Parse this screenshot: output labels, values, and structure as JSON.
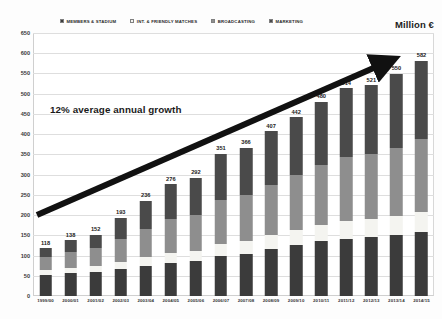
{
  "unit_caption": "Million €",
  "annotation": "12% average annual growth",
  "legend": [
    {
      "label": "MEMBERS & STADIUM",
      "color": "#3b3b3b",
      "icon": "square-swatch-icon"
    },
    {
      "label": "INT. & FRIENDLY MATCHES",
      "color": "#f4f4f0",
      "icon": "square-swatch-icon"
    },
    {
      "label": "BROADCASTING",
      "color": "#8e8e8e",
      "icon": "square-swatch-icon"
    },
    {
      "label": "MARKETING",
      "color": "#4a4a4a",
      "icon": "square-swatch-icon"
    }
  ],
  "chart_data": {
    "type": "bar",
    "stacked": true,
    "title": "",
    "subtitle": "",
    "xlabel": "",
    "ylabel": "Million €",
    "ylim": [
      0,
      650
    ],
    "ytick_step": 50,
    "yticks": [
      0,
      50,
      100,
      150,
      200,
      250,
      300,
      350,
      400,
      450,
      500,
      550,
      600,
      650
    ],
    "ytick_labels": [
      "0",
      "50",
      "100",
      "150",
      "200",
      "250",
      "300",
      "350",
      "400",
      "450",
      "500",
      "550",
      "600",
      "650"
    ],
    "grid": true,
    "legend_position": "top",
    "categories": [
      "1999/00",
      "2000/01",
      "2001/02",
      "2002/03",
      "2003/04",
      "2004/05",
      "2005/06",
      "2006/07",
      "2007/08",
      "2008/09",
      "2009/10",
      "2010/11",
      "2011/12",
      "2012/13",
      "2013/14",
      "2014/15"
    ],
    "totals": [
      118,
      138,
      152,
      193,
      236,
      276,
      292,
      351,
      366,
      407,
      442,
      480,
      514,
      521,
      550,
      582
    ],
    "total_labels": [
      "118",
      "138",
      "152",
      "193",
      "236",
      "276",
      "292",
      "351",
      "366",
      "407",
      "442",
      "480",
      "514",
      "521",
      "550",
      "582"
    ],
    "series": [
      {
        "name": "MEMBERS & STADIUM",
        "color": "#3b3b3b",
        "values": [
          52,
          57,
          60,
          66,
          74,
          82,
          86,
          99,
          105,
          116,
          125,
          135,
          142,
          146,
          150,
          157
        ]
      },
      {
        "name": "INT. & FRIENDLY MATCHES",
        "color": "#f4f4f0",
        "values": [
          12,
          13,
          14,
          18,
          22,
          24,
          26,
          30,
          32,
          35,
          38,
          41,
          44,
          45,
          48,
          50
        ]
      },
      {
        "name": "BROADCASTING",
        "color": "#8e8e8e",
        "values": [
          33,
          40,
          44,
          57,
          70,
          84,
          88,
          108,
          112,
          124,
          135,
          147,
          158,
          160,
          169,
          180
        ]
      },
      {
        "name": "MARKETING",
        "color": "#4a4a4a",
        "values": [
          21,
          28,
          34,
          52,
          70,
          86,
          92,
          114,
          117,
          132,
          144,
          157,
          170,
          170,
          183,
          195
        ]
      }
    ],
    "annotations": [
      {
        "text": "12% average annual growth",
        "type": "text"
      },
      {
        "text": "",
        "type": "trend-arrow",
        "from_value": 200,
        "to_value": 600,
        "description": "thick black upward arrow spanning the plot"
      }
    ]
  }
}
